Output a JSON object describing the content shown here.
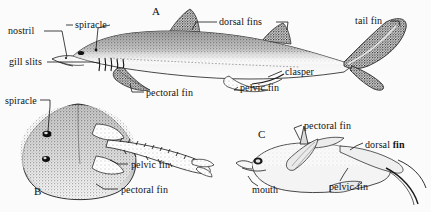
{
  "plate": {
    "background_color": "#fbfbfb",
    "ink_color": "#1a1a1a",
    "width": 431,
    "height": 212
  },
  "figures": [
    {
      "letter": "A",
      "subject": "dogfish-shark-lateral-view",
      "letter_x": 152,
      "letter_y": 6
    },
    {
      "letter": "B",
      "subject": "skate-ray-dorsal-view",
      "letter_x": 34,
      "letter_y": 186
    },
    {
      "letter": "C",
      "subject": "chimaera-lateral-view",
      "letter_x": 258,
      "letter_y": 129
    }
  ],
  "labels": [
    {
      "id": "a-nostril",
      "text": "nostril",
      "figure": "A",
      "x": 8,
      "y": 26,
      "bold_tail": ""
    },
    {
      "id": "a-spiracle",
      "text": "spiracle",
      "figure": "A",
      "x": 75,
      "y": 20,
      "bold_tail": ""
    },
    {
      "id": "a-gill-slits",
      "text": "gill slits",
      "figure": "A",
      "x": 9,
      "y": 57,
      "bold_tail": ""
    },
    {
      "id": "a-pectoral-fin",
      "text": "pectoral fin",
      "figure": "A",
      "x": 146,
      "y": 88,
      "bold_tail": ""
    },
    {
      "id": "a-dorsal-fins",
      "text": "dorsal fins",
      "figure": "A",
      "x": 219,
      "y": 17,
      "bold_tail": ""
    },
    {
      "id": "a-pelvic-fin",
      "text": "pelvic fin",
      "figure": "A",
      "x": 240,
      "y": 83,
      "bold_tail": ""
    },
    {
      "id": "a-clasper",
      "text": "clasper",
      "figure": "A",
      "x": 285,
      "y": 67,
      "bold_tail": ""
    },
    {
      "id": "a-tail-fin",
      "text": "tail fin",
      "figure": "A",
      "x": 355,
      "y": 16,
      "bold_tail": ""
    },
    {
      "id": "b-spiracle",
      "text": "spiracle",
      "figure": "B",
      "x": 5,
      "y": 96,
      "bold_tail": ""
    },
    {
      "id": "b-pelvic-fin",
      "text": "pelvic fin",
      "figure": "B",
      "x": 131,
      "y": 160,
      "bold_tail": ""
    },
    {
      "id": "b-pectoral-fin",
      "text": "pectoral fin",
      "figure": "B",
      "x": 121,
      "y": 185,
      "bold_tail": ""
    },
    {
      "id": "c-pectoral-fin",
      "text": "pectoral fin",
      "figure": "C",
      "x": 304,
      "y": 121,
      "bold_tail": ""
    },
    {
      "id": "c-dorsal-fin",
      "text": "dorsal ",
      "figure": "C",
      "x": 365,
      "y": 140,
      "bold_tail": "fin"
    },
    {
      "id": "c-mouth",
      "text": "mouth",
      "figure": "C",
      "x": 252,
      "y": 185,
      "bold_tail": ""
    },
    {
      "id": "c-pelvic-fin",
      "text": "pelvic fin",
      "figure": "C",
      "x": 329,
      "y": 182,
      "bold_tail": ""
    }
  ]
}
